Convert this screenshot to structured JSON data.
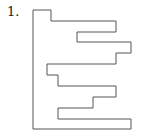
{
  "problem": {
    "number_label": "1."
  },
  "figure": {
    "stroke_color": "#555555",
    "points": "33,10 51,10 51,21 116,21 116,32 77,32 77,42 131,42 131,53 116,53 116,64 47,64 47,75 58,75 58,86 116,86 116,97 93,97 93,108 58,108 58,119 131,119 131,129 33,129"
  }
}
